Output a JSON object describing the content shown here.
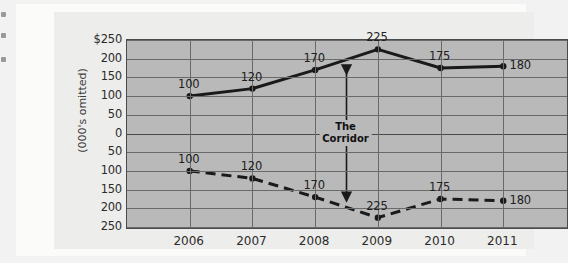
{
  "chart_data": {
    "type": "line",
    "title": "",
    "xlabel": "",
    "ylabel": "(000's omitted)",
    "categories": [
      "2006",
      "2007",
      "2008",
      "2009",
      "2010",
      "2011"
    ],
    "series": [
      {
        "name": "upper-series",
        "style": "solid",
        "values": [
          100,
          120,
          170,
          225,
          175,
          180
        ],
        "labels": [
          "100",
          "120",
          "170",
          "225",
          "175",
          "180"
        ]
      },
      {
        "name": "lower-series",
        "style": "dashed",
        "values": [
          -100,
          -120,
          -170,
          -225,
          -175,
          -180
        ],
        "labels": [
          "100",
          "120",
          "170",
          "225",
          "175",
          "180"
        ]
      }
    ],
    "ylim": [
      -250,
      250
    ],
    "y_ticks": [
      250,
      200,
      150,
      100,
      50,
      0,
      50,
      100,
      150,
      200,
      250
    ],
    "y_tick_labels": [
      "$250",
      "200",
      "150",
      "100",
      "50",
      "0",
      "50",
      "100",
      "150",
      "200",
      "250"
    ],
    "grid": true,
    "legend": "none",
    "annotations": [
      {
        "name": "corridor",
        "text_line1": "The",
        "text_line2": "Corridor",
        "kind": "double-headed-arrow",
        "x_position": "between 2008 and 2009",
        "from_value": 170,
        "to_value": -170
      }
    ],
    "colors": {
      "plot_background": "#b9b9b9",
      "card_background": "#ededeb",
      "page_background": "#fbfbfa",
      "line": "#1a1a1a",
      "grid": "#6a6a6a",
      "axis": "#4a4a4a",
      "text": "#202020"
    }
  }
}
